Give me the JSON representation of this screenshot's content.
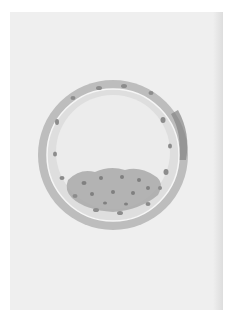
{
  "image": {
    "subject": "watercolor illustration of a blastocyst",
    "background_color": "#ffffff",
    "paper_color": "#efefef",
    "shell_color": "#b4b4b4",
    "shell_dark_accent": "#7a7a7a",
    "cavity_color": "#ededed",
    "inner_cell_mass_color": "#a8a8a8",
    "nucleus_color": "#8c8c8c"
  }
}
